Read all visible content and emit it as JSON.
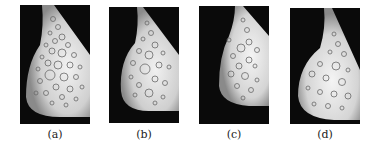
{
  "figure": {
    "panels": [
      {
        "id": "a",
        "caption": "(a)",
        "x": 20,
        "y": 5,
        "w": 70,
        "h": 119
      },
      {
        "id": "b",
        "caption": "(b)",
        "x": 109,
        "y": 7,
        "w": 70,
        "h": 116
      },
      {
        "id": "c",
        "caption": "(c)",
        "x": 199,
        "y": 6,
        "w": 70,
        "h": 118
      },
      {
        "id": "d",
        "caption": "(d)",
        "x": 290,
        "y": 8,
        "w": 70,
        "h": 116
      }
    ],
    "colors": {
      "background": "#0a0a0a",
      "tissue": "#d8d8d8",
      "circle": "#6a6a6a",
      "caption": "#222222"
    }
  }
}
